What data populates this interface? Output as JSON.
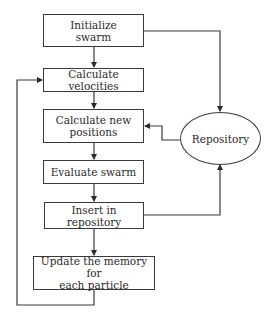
{
  "diagram": {
    "type": "flowchart",
    "nodes": [
      {
        "id": "init",
        "label": "Initialize swarm",
        "line1": "Initialize",
        "line2": "swarm",
        "shape": "rect"
      },
      {
        "id": "vel",
        "label": "Calculate velocities",
        "shape": "rect"
      },
      {
        "id": "pos",
        "label": "Calculate new positions",
        "line1": "Calculate new",
        "line2": "positions",
        "shape": "rect"
      },
      {
        "id": "eval",
        "label": "Evaluate swarm",
        "shape": "rect"
      },
      {
        "id": "insert",
        "label": "Insert in repository",
        "shape": "rect"
      },
      {
        "id": "update",
        "label": "Update the memory for each particle",
        "line1": "Update the memory for",
        "line2": "each particle",
        "shape": "rect"
      },
      {
        "id": "repo",
        "label": "Repository",
        "shape": "ellipse"
      }
    ],
    "edges": [
      {
        "from": "init",
        "to": "vel"
      },
      {
        "from": "vel",
        "to": "pos"
      },
      {
        "from": "pos",
        "to": "eval"
      },
      {
        "from": "eval",
        "to": "insert"
      },
      {
        "from": "insert",
        "to": "update"
      },
      {
        "from": "update",
        "to": "vel",
        "note": "loop back"
      },
      {
        "from": "init",
        "to": "repo"
      },
      {
        "from": "insert",
        "to": "repo"
      },
      {
        "from": "repo",
        "to": "pos"
      }
    ]
  }
}
